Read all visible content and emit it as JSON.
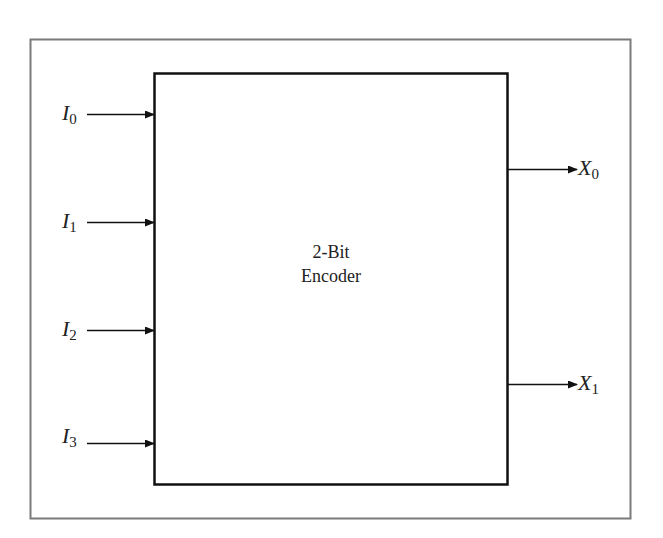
{
  "diagram": {
    "block": {
      "title_line1": "2-Bit",
      "title_line2": "Encoder"
    },
    "inputs": [
      {
        "name": "I",
        "sub": "0"
      },
      {
        "name": "I",
        "sub": "1"
      },
      {
        "name": "I",
        "sub": "2"
      },
      {
        "name": "I",
        "sub": "3"
      }
    ],
    "outputs": [
      {
        "name": "X",
        "sub": "0"
      },
      {
        "name": "X",
        "sub": "1"
      }
    ],
    "colors": {
      "frame": "#7a7a7a",
      "block": "#111111",
      "text": "#222222"
    }
  }
}
